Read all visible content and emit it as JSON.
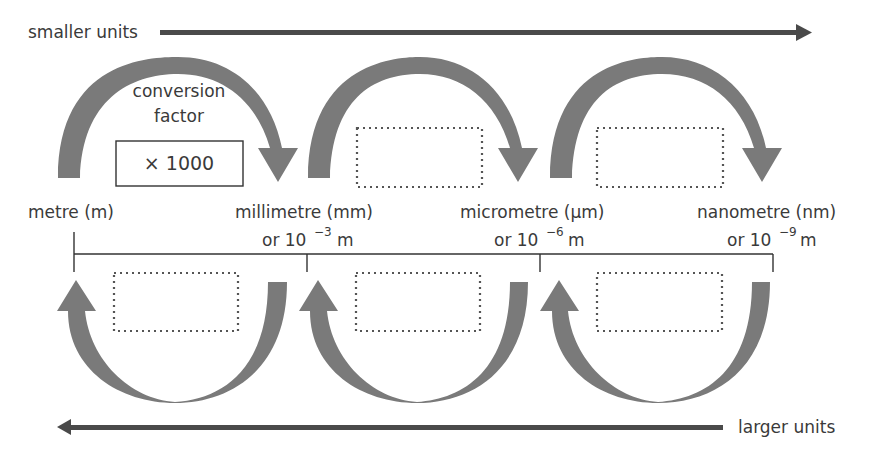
{
  "direction_labels": {
    "smaller": "smaller units",
    "larger": "larger units"
  },
  "conversion": {
    "label_line1": "conversion",
    "label_line2": "factor",
    "value": "× 1000"
  },
  "units": [
    {
      "name": "metre (m)",
      "power_prefix": "",
      "power_exp": "",
      "power_suffix": ""
    },
    {
      "name": "millimetre (mm)",
      "power_prefix": "or 10",
      "power_exp": "−3",
      "power_suffix": "m"
    },
    {
      "name": "micrometre (µm)",
      "power_prefix": "or 10",
      "power_exp": "−6",
      "power_suffix": "m"
    },
    {
      "name": "nanometre (nm)",
      "power_prefix": "or 10",
      "power_exp": "−9",
      "power_suffix": "m"
    }
  ],
  "blank_boxes": {
    "top": [
      "",
      ""
    ],
    "bottom": [
      "",
      "",
      ""
    ]
  },
  "colors": {
    "arc_fill": "#7a7a7a",
    "line_arrow": "#4a4a4a",
    "text": "#3a3a3a"
  }
}
